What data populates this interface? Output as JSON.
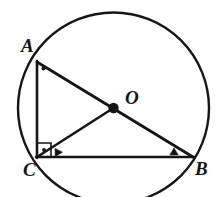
{
  "figure": {
    "stroke_color": "#151515",
    "fill_color": "#ffffff",
    "background": "#ffffff",
    "circle": {
      "center_x": 113.5,
      "center_y": 108,
      "radius": 95.5,
      "stroke_width": 2.4
    },
    "points": [
      {
        "name": "A",
        "label": "A",
        "x": 37,
        "y": 62,
        "label_x": 21,
        "label_y": 36
      },
      {
        "name": "B",
        "label": "B",
        "x": 193,
        "y": 157,
        "label_x": 195,
        "label_y": 159
      },
      {
        "name": "C",
        "label": "C",
        "x": 37,
        "y": 157,
        "label_x": 23,
        "label_y": 160
      },
      {
        "name": "O",
        "label": "O",
        "x": 113.5,
        "y": 108,
        "label_x": 125,
        "label_y": 88
      }
    ],
    "segments": [
      {
        "name": "segment-AC",
        "from": "A",
        "to": "C",
        "x1": 37,
        "y1": 62,
        "x2": 37,
        "y2": 157
      },
      {
        "name": "segment-CB",
        "from": "C",
        "to": "B",
        "x1": 37,
        "y1": 157,
        "x2": 193,
        "y2": 157
      },
      {
        "name": "segment-AB",
        "from": "A",
        "to": "B",
        "x1": 37,
        "y1": 62,
        "x2": 193,
        "y2": 157
      },
      {
        "name": "segment-CO",
        "from": "C",
        "to": "O",
        "x1": 37,
        "y1": 157,
        "x2": 113.5,
        "y2": 108
      }
    ],
    "center_dot": {
      "cx": 113.5,
      "cy": 108,
      "r": 5.2
    },
    "right_angle_mark": {
      "vertex": "C",
      "points": "37,143 51,143 51,157 37,157",
      "dot_cx": 44,
      "dot_cy": 150,
      "dot_r": 1.9
    },
    "angle_dot_A": {
      "cx": 43.5,
      "cy": 68.5,
      "r": 2.0
    },
    "tick_marks": [
      {
        "name": "tick-CO",
        "cx": 57,
        "cy": 151.5,
        "rotation": -32
      },
      {
        "name": "tick-CB",
        "cx": 174,
        "cy": 151.5,
        "rotation": 0
      }
    ]
  }
}
